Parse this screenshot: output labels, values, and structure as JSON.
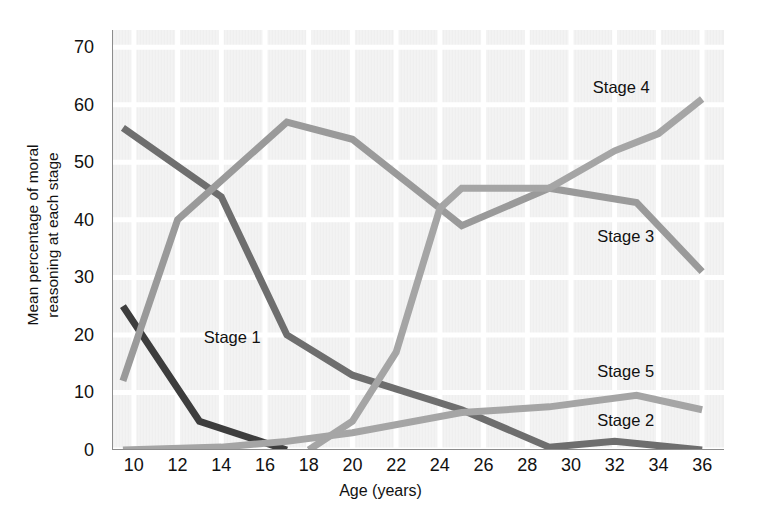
{
  "chart_data": {
    "type": "line",
    "title": "",
    "xlabel": "Age (years)",
    "ylabel": "Mean percentage of moral reasoning at each stage",
    "ylabel_line1": "Mean percentage of moral",
    "ylabel_line2": "reasoning at each stage",
    "xlim": [
      9,
      37
    ],
    "ylim": [
      0,
      73
    ],
    "xticks": [
      10,
      12,
      14,
      16,
      18,
      20,
      22,
      24,
      26,
      28,
      30,
      32,
      34,
      36
    ],
    "yticks": [
      0,
      10,
      20,
      30,
      40,
      50,
      60,
      70
    ],
    "grid": true,
    "legend_position": "inline-right",
    "background": "#f0f0f0",
    "plot_background": "#efefef",
    "gridline_color": "#ffffff",
    "axis_color": "#8c8c8c",
    "series": [
      {
        "name": "Stage 1",
        "color": "#3d3d3d",
        "label_x": 13.2,
        "label_y": 19.5,
        "x": [
          9.5,
          13,
          17
        ],
        "values": [
          25,
          5,
          0
        ]
      },
      {
        "name": "Stage 2",
        "color": "#6e6e6e",
        "label_x": 31.2,
        "label_y": 5.0,
        "x": [
          9.5,
          14,
          17,
          20,
          25,
          29,
          32,
          36
        ],
        "values": [
          56,
          44,
          20,
          13,
          7,
          0.5,
          1.5,
          0
        ]
      },
      {
        "name": "Stage 3",
        "color": "#9a9a9a",
        "label_x": 31.2,
        "label_y": 37.0,
        "x": [
          9.5,
          12,
          17,
          20,
          24,
          25,
          29,
          33,
          36
        ],
        "values": [
          12,
          40,
          57,
          54,
          42,
          39,
          45.5,
          43,
          31
        ]
      },
      {
        "name": "Stage 4",
        "color": "#a5a5a5",
        "label_x": 31.0,
        "label_y": 63.0,
        "x": [
          18,
          20,
          22,
          24,
          25,
          29,
          32,
          34,
          36
        ],
        "values": [
          0,
          5,
          17,
          42,
          45.5,
          45.5,
          52,
          55,
          61
        ]
      },
      {
        "name": "Stage 5",
        "color": "#a5a5a5",
        "label_x": 31.2,
        "label_y": 13.5,
        "x": [
          9.5,
          14,
          17,
          20,
          25,
          29,
          33,
          36
        ],
        "values": [
          0,
          0.5,
          1.5,
          3,
          6.5,
          7.5,
          9.5,
          7
        ]
      }
    ]
  },
  "series_labels": [
    {
      "name": "Stage 4",
      "text": "Stage 4"
    },
    {
      "name": "Stage 3",
      "text": "Stage 3"
    },
    {
      "name": "Stage 5",
      "text": "Stage 5"
    },
    {
      "name": "Stage 2",
      "text": "Stage 2"
    },
    {
      "name": "Stage 1",
      "text": "Stage 1"
    }
  ]
}
